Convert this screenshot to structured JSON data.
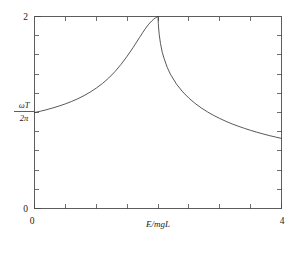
{
  "chart_data": {
    "type": "line",
    "title": "",
    "subtitle": "",
    "xlabel": "E/mgL",
    "ylabel_numerator": "ωT",
    "ylabel_denominator": "2π",
    "ylabel": "ωT / 2π",
    "xlim": [
      0,
      4
    ],
    "ylim": [
      0,
      2
    ],
    "x_tick_labels": [
      "0",
      "4"
    ],
    "x_tick_values": [
      0,
      4
    ],
    "x_minor_tick_values": [
      0.5,
      1,
      1.5,
      2,
      2.5,
      3,
      3.5
    ],
    "y_tick_labels": [
      "0",
      "2"
    ],
    "y_tick_values": [
      0,
      2
    ],
    "y_minor_tick_values": [
      0.2,
      0.4,
      0.6,
      0.8,
      1.0,
      1.2,
      1.4,
      1.6,
      1.8
    ],
    "grid": false,
    "legend": false,
    "legend_position": "none",
    "asymptote_x": 2.0,
    "line_color": "#3a3a3a",
    "axis_color": "#4a4a4a",
    "background_color": "#ffffff",
    "annotations": [
      "Vertical asymptote at E/mgL = 2 (separatrix of the pendulum)",
      "Left branch rises from about 1.0 at E/mgL = 0 to 2 at E/mgL = 2",
      "Right branch falls from 2 at E/mgL = 2 to about 0.63 at E/mgL = 4"
    ],
    "series": [
      {
        "name": "libration branch",
        "x": [
          0.0,
          0.1,
          0.2,
          0.3,
          0.4,
          0.5,
          0.6,
          0.7,
          0.8,
          0.9,
          1.0,
          1.1,
          1.2,
          1.3,
          1.4,
          1.5,
          1.6,
          1.7,
          1.75,
          1.8,
          1.85,
          1.9,
          1.93,
          1.96,
          1.98,
          1.99,
          1.995,
          2.0
        ],
        "y": [
          1.0,
          1.014,
          1.03,
          1.048,
          1.068,
          1.09,
          1.115,
          1.143,
          1.175,
          1.212,
          1.254,
          1.302,
          1.358,
          1.424,
          1.5,
          1.586,
          1.68,
          1.78,
          1.83,
          1.878,
          1.92,
          1.955,
          1.972,
          1.986,
          1.993,
          1.997,
          1.999,
          2.0
        ]
      },
      {
        "name": "rotation branch",
        "x": [
          2.0,
          2.005,
          2.01,
          2.02,
          2.04,
          2.07,
          2.1,
          2.15,
          2.2,
          2.3,
          2.4,
          2.5,
          2.6,
          2.7,
          2.8,
          2.9,
          3.0,
          3.1,
          3.2,
          3.3,
          3.4,
          3.5,
          3.6,
          3.7,
          3.8,
          3.9,
          4.0
        ],
        "y": [
          2.0,
          1.93,
          1.88,
          1.81,
          1.72,
          1.625,
          1.56,
          1.47,
          1.4,
          1.295,
          1.215,
          1.15,
          1.095,
          1.048,
          1.007,
          0.97,
          0.938,
          0.908,
          0.881,
          0.857,
          0.835,
          0.814,
          0.795,
          0.777,
          0.76,
          0.745,
          0.73
        ]
      }
    ]
  },
  "figure": {
    "x_axis_label": "E/mgL",
    "y_axis_numerator": "ωT",
    "y_axis_denominator": "2π",
    "x_min_label": "0",
    "x_max_label": "4",
    "y_min_label": "0",
    "y_max_label": "2"
  }
}
